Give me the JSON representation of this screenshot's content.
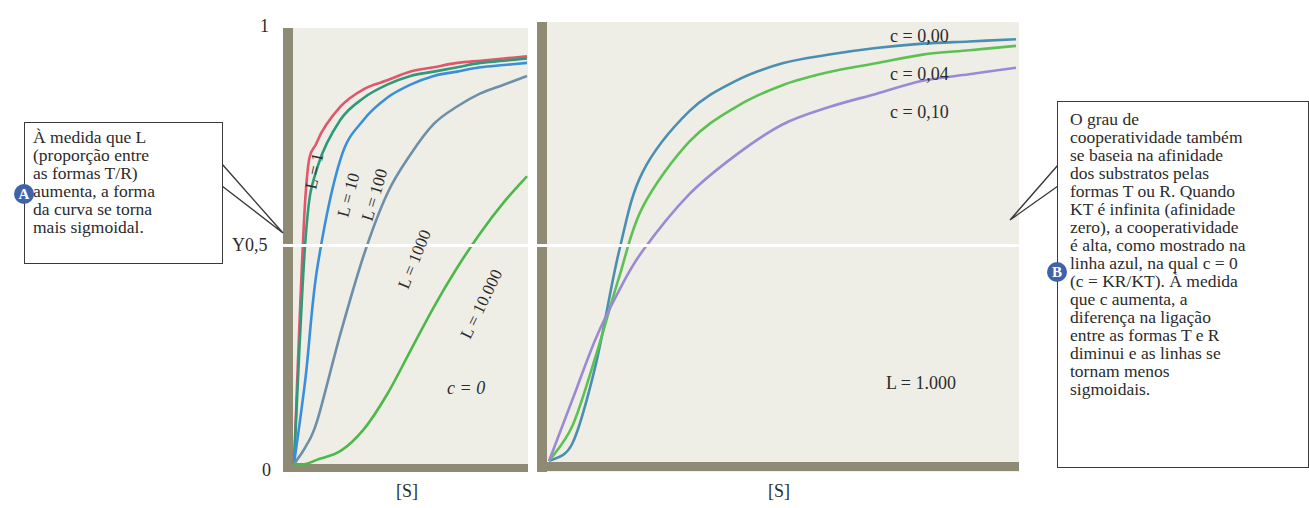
{
  "chart_data": [
    {
      "type": "line",
      "title": "",
      "xlabel": "[S]",
      "ylabel": "Y",
      "ylim": [
        0,
        1
      ],
      "yticks": [
        "0",
        "0,5",
        "1"
      ],
      "grid": false,
      "annotations": [
        "c = 0"
      ],
      "x": [
        0,
        0.05,
        0.1,
        0.2,
        0.3,
        0.4,
        0.5,
        0.6,
        0.7,
        0.8,
        0.9,
        1.0
      ],
      "series": [
        {
          "name": "L = 1",
          "color": "#e2566b",
          "values": [
            0,
            0.62,
            0.74,
            0.82,
            0.86,
            0.88,
            0.9,
            0.91,
            0.92,
            0.925,
            0.93,
            0.935
          ]
        },
        {
          "name": "L = 10",
          "color": "#2f9a7a",
          "values": [
            0,
            0.52,
            0.68,
            0.79,
            0.84,
            0.87,
            0.89,
            0.9,
            0.91,
            0.92,
            0.925,
            0.93
          ]
        },
        {
          "name": "L = 100",
          "color": "#3b8fd9",
          "values": [
            0,
            0.2,
            0.45,
            0.7,
            0.79,
            0.84,
            0.87,
            0.89,
            0.9,
            0.91,
            0.915,
            0.92
          ]
        },
        {
          "name": "L = 1000",
          "color": "#6e8fa8",
          "values": [
            0,
            0.04,
            0.1,
            0.3,
            0.48,
            0.62,
            0.71,
            0.78,
            0.82,
            0.85,
            0.87,
            0.89
          ]
        },
        {
          "name": "L = 10.000",
          "color": "#4db84a",
          "values": [
            0,
            0.0,
            0.01,
            0.03,
            0.08,
            0.16,
            0.26,
            0.36,
            0.45,
            0.53,
            0.6,
            0.66
          ]
        }
      ]
    },
    {
      "type": "line",
      "title": "",
      "xlabel": "[S]",
      "ylabel": "",
      "ylim": [
        0,
        1
      ],
      "grid": false,
      "annotations": [
        "L = 1.000"
      ],
      "x": [
        0,
        0.05,
        0.1,
        0.15,
        0.2,
        0.3,
        0.4,
        0.5,
        0.6,
        0.7,
        0.8,
        0.9,
        1.0
      ],
      "series": [
        {
          "name": "c = 0,00",
          "color": "#4a8fb2",
          "values": [
            0,
            0.04,
            0.22,
            0.48,
            0.66,
            0.8,
            0.87,
            0.91,
            0.93,
            0.945,
            0.955,
            0.96,
            0.965
          ]
        },
        {
          "name": "c = 0,04",
          "color": "#5cc153",
          "values": [
            0,
            0.08,
            0.24,
            0.42,
            0.58,
            0.73,
            0.81,
            0.86,
            0.89,
            0.91,
            0.93,
            0.94,
            0.95
          ]
        },
        {
          "name": "c = 0,10",
          "color": "#9a8ad6",
          "values": [
            0,
            0.14,
            0.28,
            0.39,
            0.48,
            0.61,
            0.7,
            0.77,
            0.81,
            0.84,
            0.87,
            0.885,
            0.9
          ]
        }
      ]
    }
  ],
  "left_panel": {
    "y_tick_top": "1",
    "y_tick_mid": "Y0,5",
    "y_tick_bottom": "0",
    "x_label": "[S]",
    "curve_labels": [
      "L = 1",
      "L = 10",
      "L = 100",
      "L = 1000",
      "L = 10.000"
    ],
    "annotation": "c = 0"
  },
  "right_panel": {
    "x_label": "[S]",
    "curve_labels": [
      "c = 0,00",
      "c = 0,04",
      "c = 0,10"
    ],
    "annotation": "L = 1.000"
  },
  "callout_a": {
    "badge": "A",
    "text": "À medida que L\n(proporção entre\nas formas T/R)\naumenta, a forma\nda curva se torna\nmais sigmoidal."
  },
  "callout_b": {
    "badge": "B",
    "text": "O grau de\ncooperatividade também\nse baseia na afinidade\ndos substratos pelas\nformas T ou R. Quando\nKT é infinita (afinidade\nzero), a cooperatividade\né alta, como mostrado na\nlinha azul, na qual c = 0\n(c = KR/KT). À medida\nque c aumenta, a\ndiferença na ligação\nentre as formas T e R\ndiminui e as linhas se\ntornam menos\nsigmoidais."
  },
  "colors": {
    "panel_bg": "#efeee6",
    "axis_band": "#8f8a74"
  }
}
